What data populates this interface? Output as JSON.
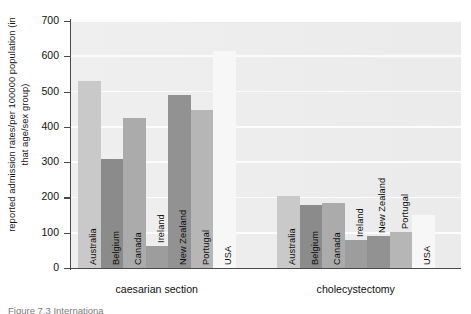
{
  "chart_data": {
    "type": "bar",
    "title": "",
    "xlabel": "",
    "ylabel": "reported admission rates/per 100000 population (in that age/sex group)",
    "ylim": [
      0,
      700
    ],
    "ytick_step": 100,
    "yticks": [
      700,
      600,
      500,
      400,
      300,
      200,
      100,
      0
    ],
    "grid": true,
    "legend": "none",
    "categories": [
      "Australia",
      "Belgium",
      "Canada",
      "Ireland",
      "New Zealand",
      "Portugal",
      "USA"
    ],
    "groups": [
      {
        "name": "caesarian section",
        "values": [
          530,
          309,
          425,
          62,
          490,
          448,
          615
        ]
      },
      {
        "name": "cholecystectomy",
        "values": [
          204,
          179,
          184,
          79,
          91,
          102,
          150
        ]
      }
    ],
    "series": [
      {
        "name": "caesarian section",
        "points": [
          {
            "category": "Australia",
            "value": 530,
            "color": "#c9c9c9"
          },
          {
            "category": "Belgium",
            "value": 309,
            "color": "#8b8b8b"
          },
          {
            "category": "Canada",
            "value": 425,
            "color": "#ababab"
          },
          {
            "category": "Ireland",
            "value": 62,
            "color": "#9d9d9d"
          },
          {
            "category": "New Zealand",
            "value": 490,
            "color": "#929292"
          },
          {
            "category": "Portugal",
            "value": 448,
            "color": "#b6b6b6"
          },
          {
            "category": "USA",
            "value": 615,
            "color": "#f7f7f7"
          }
        ]
      },
      {
        "name": "cholecystectomy",
        "points": [
          {
            "category": "Australia",
            "value": 204,
            "color": "#c9c9c9"
          },
          {
            "category": "Belgium",
            "value": 179,
            "color": "#8b8b8b"
          },
          {
            "category": "Canada",
            "value": 184,
            "color": "#ababab"
          },
          {
            "category": "Ireland",
            "value": 79,
            "color": "#9d9d9d"
          },
          {
            "category": "New Zealand",
            "value": 91,
            "color": "#929292"
          },
          {
            "category": "Portugal",
            "value": 102,
            "color": "#b6b6b6"
          },
          {
            "category": "USA",
            "value": 150,
            "color": "#f7f7f7"
          }
        ]
      }
    ],
    "plot_background": "#ededed",
    "gridline_color": "#fcfcfc",
    "axis_color": "#4a4a4a"
  },
  "axis": {
    "y_title": "reported admission rates/per 100000 population (in that age/sex group)",
    "ticks": [
      "700",
      "600",
      "500",
      "400",
      "300",
      "200",
      "100",
      "0"
    ]
  },
  "groups": {
    "caesarian_label": "caesarian section",
    "cholecystectomy_label": "cholecystectomy"
  },
  "caption": {
    "text": "Figure 7.3  Internationa"
  }
}
